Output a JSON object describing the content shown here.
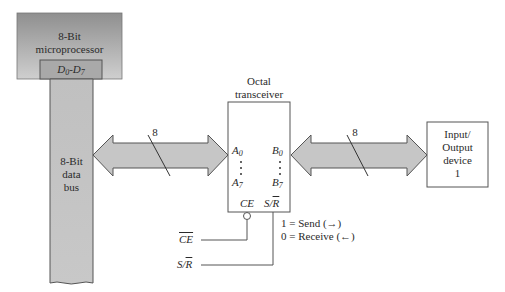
{
  "diagram": {
    "microprocessor": {
      "title_line1": "8-Bit",
      "title_line2": "microprocessor",
      "port": "D",
      "port_sub0": "0",
      "port_sep": "-D",
      "port_sub1": "7"
    },
    "data_bus": {
      "line1": "8-Bit",
      "line2": "data",
      "line3": "bus"
    },
    "left_bus": {
      "width_label": "8"
    },
    "right_bus": {
      "width_label": "8"
    },
    "transceiver": {
      "title_line1": "Octal",
      "title_line2": "transceiver",
      "a_top": "A",
      "a_top_sub": "0",
      "a_bot": "A",
      "a_bot_sub": "7",
      "b_top": "B",
      "b_top_sub": "0",
      "b_bot": "B",
      "b_bot_sub": "7",
      "ce_pin": "CE",
      "sr_pin_s": "S/",
      "sr_pin_r": "R"
    },
    "io_device": {
      "line1": "Input/",
      "line2": "Output",
      "line3": "device",
      "line4": "1"
    },
    "signals": {
      "ce_input": "CE",
      "sr_input_s": "S/",
      "sr_input_r": "R"
    },
    "legend": {
      "send": "1 = Send (→)",
      "receive": "0 = Receive (←)"
    },
    "colors": {
      "block_fill_top": "#9a9a9a",
      "block_fill_bottom": "#c8c8c8",
      "bus_fill": "#c4c4c4",
      "arrow_fill": "#c6c6c6",
      "stroke": "#555555"
    }
  }
}
